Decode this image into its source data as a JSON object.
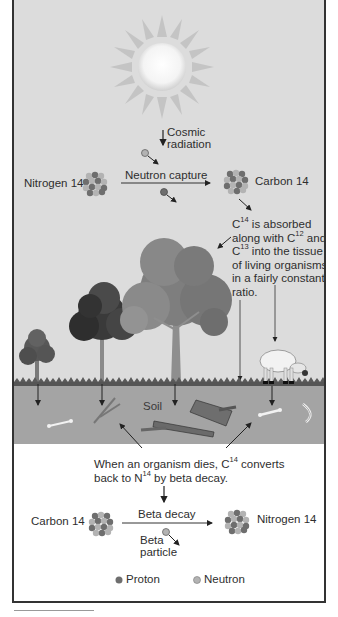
{
  "diagram": {
    "colors": {
      "sky": "#dcdcdc",
      "soil": "#a4a4a4",
      "background": "#ffffff",
      "proton": "#6e6e6e",
      "neutron": "#b3b3b3",
      "text": "#2e2e2e"
    },
    "top": {
      "cosmic_radiation_line1": "Cosmic",
      "cosmic_radiation_line2": "radiation",
      "left_atom_label": "Nitrogen 14",
      "reaction_label": "Neutron capture",
      "right_atom_label": "Carbon 14"
    },
    "absorption_note": {
      "line1_pre": "C",
      "line1_sup": "14",
      "line1_post": " is absorbed",
      "line2_pre": "along with C",
      "line2_sup": "12",
      "line2_post": " and",
      "line3_pre": "C",
      "line3_sup": "13",
      "line3_post": " into the tissue",
      "line4": "of living organisms",
      "line5": "in a fairly constant",
      "line6": "ratio."
    },
    "soil_label": "Soil",
    "death_note": {
      "line1_pre": "When an organism dies, C",
      "line1_sup": "14",
      "line1_post": " converts",
      "line2_pre": "back to N",
      "line2_sup": "14",
      "line2_post": " by beta decay."
    },
    "bottom": {
      "left_atom_label": "Carbon 14",
      "reaction_label": "Beta decay",
      "right_atom_label": "Nitrogen 14",
      "particle_line1": "Beta",
      "particle_line2": "particle"
    },
    "legend": [
      {
        "label": "Proton",
        "icon": "proton-dot-icon"
      },
      {
        "label": "Neutron",
        "icon": "neutron-dot-icon"
      }
    ]
  }
}
